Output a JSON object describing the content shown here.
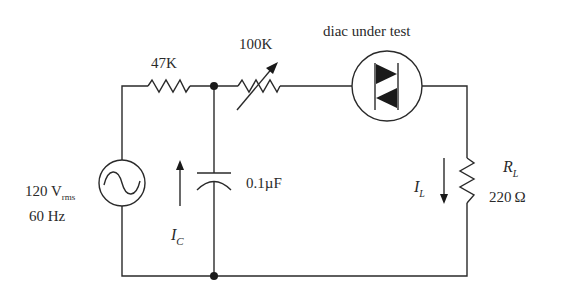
{
  "diagram": {
    "type": "circuit-schematic",
    "components": {
      "source": {
        "voltage": "120 V",
        "voltage_sub": "rms",
        "frequency": "60 Hz"
      },
      "r1": {
        "label": "47K"
      },
      "r2_variable": {
        "label": "100K"
      },
      "diac": {
        "label": "diac under test"
      },
      "capacitor": {
        "label": "0.1µF"
      },
      "load": {
        "name": "R",
        "name_sub": "L",
        "value": "220 Ω"
      }
    },
    "currents": {
      "ic": {
        "name": "I",
        "sub": "C",
        "direction": "up"
      },
      "il": {
        "name": "I",
        "sub": "L",
        "direction": "down"
      }
    }
  }
}
